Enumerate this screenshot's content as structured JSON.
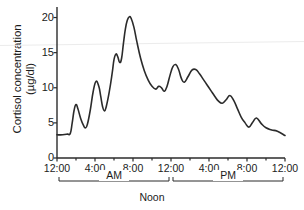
{
  "chart_data": {
    "type": "line",
    "title": "",
    "xlabel": "Noon",
    "ylabel": "Cortisol concentration (µg/dl)",
    "ylabel_line1": "Cortisol concentration",
    "ylabel_line2": "(µg/dl)",
    "xlim": [
      0,
      24
    ],
    "ylim": [
      0,
      21.5
    ],
    "yticks": [
      0,
      5,
      10,
      15,
      20
    ],
    "ytick_labels": [
      "0",
      "5",
      "10",
      "15",
      "20"
    ],
    "xticks": [
      0,
      4,
      8,
      12,
      16,
      20,
      24
    ],
    "xtick_labels": [
      "12:00",
      "4:00",
      "8:00",
      "12:00",
      "4:00",
      "8:00",
      "12:00"
    ],
    "xtick_minor": [
      2,
      6,
      10,
      14,
      18,
      22
    ],
    "grid": false,
    "legend": null,
    "line_color": "#2b2b2b",
    "line_width": 1.6,
    "annotations": [
      {
        "label": "AM",
        "span_hours": [
          0,
          12
        ]
      },
      {
        "label": "PM",
        "span_hours": [
          12,
          24
        ]
      },
      {
        "label": "Noon",
        "at_hour": 12
      }
    ],
    "series": [
      {
        "name": "Cortisol concentration",
        "units": "µg/dl",
        "x": [
          0.0,
          0.6,
          1.1,
          1.4,
          1.6,
          1.8,
          2.0,
          2.2,
          2.5,
          2.8,
          3.0,
          3.2,
          3.5,
          3.8,
          4.1,
          4.4,
          4.6,
          4.8,
          5.0,
          5.2,
          5.5,
          5.8,
          6.0,
          6.2,
          6.4,
          6.6,
          6.8,
          7.0,
          7.2,
          7.4,
          7.6,
          7.8,
          8.1,
          8.4,
          8.8,
          9.2,
          9.6,
          10.0,
          10.4,
          10.7,
          11.0,
          11.3,
          11.6,
          11.9,
          12.2,
          12.5,
          12.8,
          13.1,
          13.4,
          13.8,
          14.2,
          14.6,
          15.0,
          15.4,
          15.8,
          16.2,
          16.6,
          17.0,
          17.4,
          17.8,
          18.2,
          18.6,
          19.0,
          19.4,
          19.8,
          20.2,
          20.6,
          21.0,
          21.5,
          22.0,
          22.6,
          23.2,
          24.0
        ],
        "y": [
          3.3,
          3.3,
          3.4,
          3.5,
          5.0,
          6.8,
          7.6,
          7.0,
          5.6,
          4.6,
          4.3,
          4.8,
          6.8,
          9.4,
          10.9,
          10.2,
          8.8,
          7.3,
          6.7,
          7.4,
          9.4,
          12.0,
          14.0,
          14.8,
          14.4,
          13.6,
          14.2,
          16.4,
          18.4,
          19.6,
          20.1,
          19.9,
          18.6,
          16.6,
          14.2,
          12.4,
          11.1,
          10.2,
          9.8,
          10.2,
          10.0,
          9.5,
          10.3,
          11.8,
          13.0,
          13.3,
          12.6,
          11.3,
          10.8,
          11.6,
          12.5,
          12.6,
          12.0,
          11.2,
          10.4,
          9.6,
          8.8,
          8.1,
          7.8,
          8.3,
          8.9,
          8.2,
          7.0,
          5.8,
          5.0,
          4.4,
          5.1,
          5.7,
          4.9,
          4.3,
          4.0,
          3.8,
          3.2
        ]
      }
    ]
  },
  "axis": {
    "y_title_line1": "Cortisol concentration",
    "y_title_line2": "(µg/dl)"
  }
}
